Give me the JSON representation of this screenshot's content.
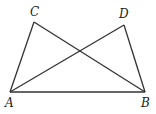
{
  "diagram": {
    "type": "geometry",
    "points": {
      "A": {
        "label": "A",
        "x": 10,
        "y": 92
      },
      "B": {
        "label": "B",
        "x": 145,
        "y": 92
      },
      "C": {
        "label": "C",
        "x": 34,
        "y": 22
      },
      "D": {
        "label": "D",
        "x": 124,
        "y": 25
      }
    },
    "segments": [
      "AB",
      "AC",
      "AD",
      "BC",
      "BD"
    ],
    "stroke_color": "#333333"
  }
}
